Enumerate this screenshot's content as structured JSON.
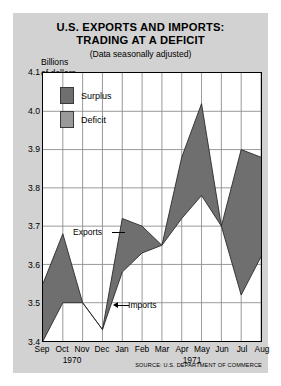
{
  "chart_data": {
    "type": "area",
    "title": "U.S. EXPORTS AND IMPORTS: TRADING AT A DEFICIT",
    "title_line1": "U.S. EXPORTS AND IMPORTS:",
    "title_line2": "TRADING AT A DEFICIT",
    "subtitle": "(Data seasonally adjusted)",
    "ylabel_line1": "Billions",
    "ylabel_line2": "of dollars",
    "xlabel": "",
    "ylim": [
      3.4,
      4.1
    ],
    "yticks": [
      "3.4",
      "3.5",
      "3.6",
      "3.7",
      "3.8",
      "3.9",
      "4.0",
      "4.1"
    ],
    "ytick_values": [
      3.4,
      3.5,
      3.6,
      3.7,
      3.8,
      3.9,
      4.0,
      4.1
    ],
    "grid": true,
    "categories": [
      "Sep",
      "Oct",
      "Nov",
      "Dec",
      "Jan",
      "Feb",
      "Mar",
      "Apr",
      "May",
      "Jun",
      "Jul",
      "Aug"
    ],
    "period_labels": [
      {
        "text": "1970",
        "center_index": 1.5
      },
      {
        "text": "1971",
        "center_index": 7.5
      }
    ],
    "series": [
      {
        "name": "Exports",
        "values": [
          3.55,
          3.68,
          3.5,
          3.43,
          3.72,
          3.7,
          3.65,
          3.72,
          3.78,
          3.7,
          3.52,
          3.62
        ]
      },
      {
        "name": "Imports",
        "values": [
          3.4,
          3.5,
          3.5,
          3.43,
          3.58,
          3.63,
          3.65,
          3.88,
          4.02,
          3.7,
          3.9,
          3.88
        ]
      }
    ],
    "legend": [
      {
        "label": "Surplus",
        "color": "#6f6f6f",
        "meaning": "exports above imports"
      },
      {
        "label": "Deficit",
        "color": "#9a9a9a",
        "meaning": "imports above exports"
      }
    ],
    "legend_position": "upper-left-inside",
    "annotations": [
      {
        "name": "exports-callout",
        "text": "Exports"
      },
      {
        "name": "imports-callout",
        "text": "Imports"
      }
    ],
    "source": "SOURCE: U.S. DEPARTMENT OF COMMERCE",
    "colors": {
      "figure_background": "#d2d2d2",
      "plot_background": "#ffffff",
      "surplus": "#6f6f6f",
      "deficit": "#9a9a9a",
      "gridline": "#8d8d8d",
      "axis": "#000000",
      "text": "#000000"
    }
  }
}
